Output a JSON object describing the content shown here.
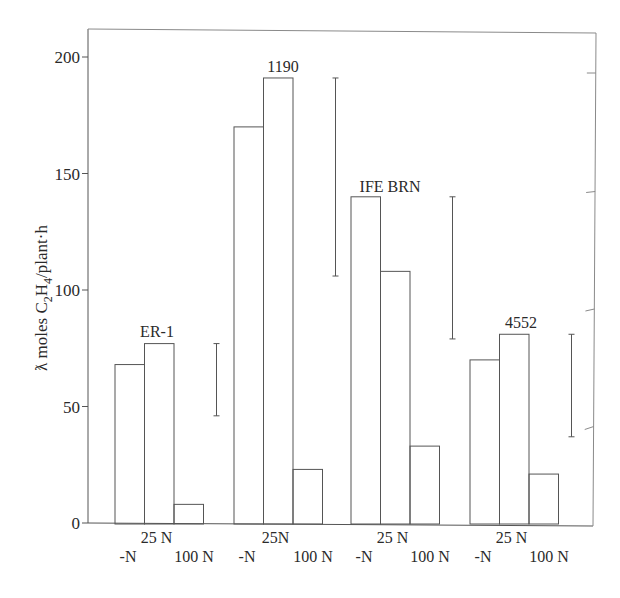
{
  "chart_data": {
    "type": "bar",
    "title": "",
    "xlabel": "",
    "ylabel": "ƛ moles C₂H₄/plant·h",
    "ylabel_parts": {
      "prefix": "ƛ moles C",
      "sub1": "2",
      "mid": "H",
      "sub2": "4",
      "suffix": "/plant·h"
    },
    "ylim": [
      0,
      210
    ],
    "yticks": [
      0,
      50,
      100,
      150,
      200
    ],
    "grid": false,
    "legend": null,
    "groups": [
      "ER-1",
      "1190",
      "IFE BRN",
      "4552"
    ],
    "treatments": [
      "-N",
      "25 N",
      "100 N"
    ],
    "group_tick_labels": [
      {
        "top": "25 N",
        "left": "-N",
        "right": "100 N"
      },
      {
        "top": "25N",
        "left": "-N",
        "right": "100 N"
      },
      {
        "top": "25 N",
        "left": "-N",
        "right": "100 N"
      },
      {
        "top": "25 N",
        "left": "-N",
        "right": "100 N"
      }
    ],
    "series": [
      {
        "name": "-N",
        "values": [
          68,
          170,
          140,
          70
        ]
      },
      {
        "name": "25 N",
        "values": [
          77,
          191,
          108,
          81
        ]
      },
      {
        "name": "100 N",
        "values": [
          8,
          23,
          33,
          21
        ]
      }
    ],
    "error_bars": [
      {
        "group": "ER-1",
        "top": 77,
        "bottom": 46
      },
      {
        "group": "1190",
        "top": 191,
        "bottom": 106
      },
      {
        "group": "IFE BRN",
        "top": 140,
        "bottom": 79
      },
      {
        "group": "4552",
        "top": 81,
        "bottom": 37
      }
    ]
  },
  "style": {
    "line_color": "#555555",
    "text_color": "#2a2a2a",
    "background": "#ffffff"
  }
}
